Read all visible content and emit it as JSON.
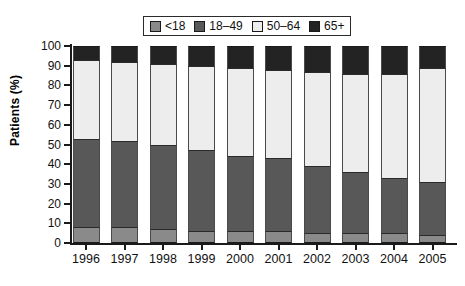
{
  "chart_data": {
    "type": "bar",
    "subtype": "stacked-bar-100-percent",
    "title": "",
    "xlabel": "",
    "ylabel": "Patients (%)",
    "ylim": [
      0,
      100
    ],
    "yticks": [
      0,
      10,
      20,
      30,
      40,
      50,
      60,
      70,
      80,
      90,
      100
    ],
    "grid": false,
    "legend_position": "top-center",
    "categories": [
      "1996",
      "1997",
      "1998",
      "1999",
      "2000",
      "2001",
      "2002",
      "2003",
      "2004",
      "2005"
    ],
    "series": [
      {
        "name": "<18",
        "color": "#8a8a8a",
        "values": [
          8,
          8,
          7,
          6,
          6,
          6,
          5,
          5,
          5,
          4
        ]
      },
      {
        "name": "18–49",
        "color": "#585858",
        "values": [
          45,
          44,
          43,
          41,
          38,
          37,
          34,
          31,
          28,
          27
        ]
      },
      {
        "name": "50–64",
        "color": "#ededed",
        "values": [
          40,
          40,
          41,
          43,
          45,
          45,
          48,
          50,
          53,
          58
        ]
      },
      {
        "name": "65+",
        "color": "#232323",
        "values": [
          7,
          8,
          9,
          10,
          11,
          12,
          13,
          14,
          14,
          11
        ]
      }
    ],
    "cumulative_tops": {
      "note": "running totals read off the axis for each stack, bottom to top",
      "1996": [
        8,
        53,
        93,
        100
      ],
      "1997": [
        8,
        52,
        92,
        100
      ],
      "1998": [
        7,
        50,
        91,
        100
      ],
      "1999": [
        6,
        47,
        90,
        100
      ],
      "2000": [
        6,
        44,
        89,
        100
      ],
      "2001": [
        6,
        43,
        88,
        100
      ],
      "2002": [
        5,
        39,
        87,
        100
      ],
      "2003": [
        5,
        36,
        86,
        100
      ],
      "2004": [
        5,
        33,
        86,
        100
      ],
      "2005": [
        4,
        31,
        89,
        100
      ]
    }
  },
  "legend": {
    "entries": [
      {
        "label": "<18"
      },
      {
        "label": "18–49"
      },
      {
        "label": "50–64"
      },
      {
        "label": "65+"
      }
    ]
  },
  "axes": {
    "y_title": "Patients (%)",
    "y_ticks": [
      "100",
      "90",
      "80",
      "70",
      "60",
      "50",
      "40",
      "30",
      "20",
      "10",
      "0"
    ],
    "x_ticks": [
      "1996",
      "1997",
      "1998",
      "1999",
      "2000",
      "2001",
      "2002",
      "2003",
      "2004",
      "2005"
    ]
  },
  "colors": {
    "under18": "#8a8a8a",
    "age18_49": "#585858",
    "age50_64": "#ededed",
    "age65plus": "#232323",
    "axis": "#1a1a1a",
    "background": "#ffffff"
  }
}
